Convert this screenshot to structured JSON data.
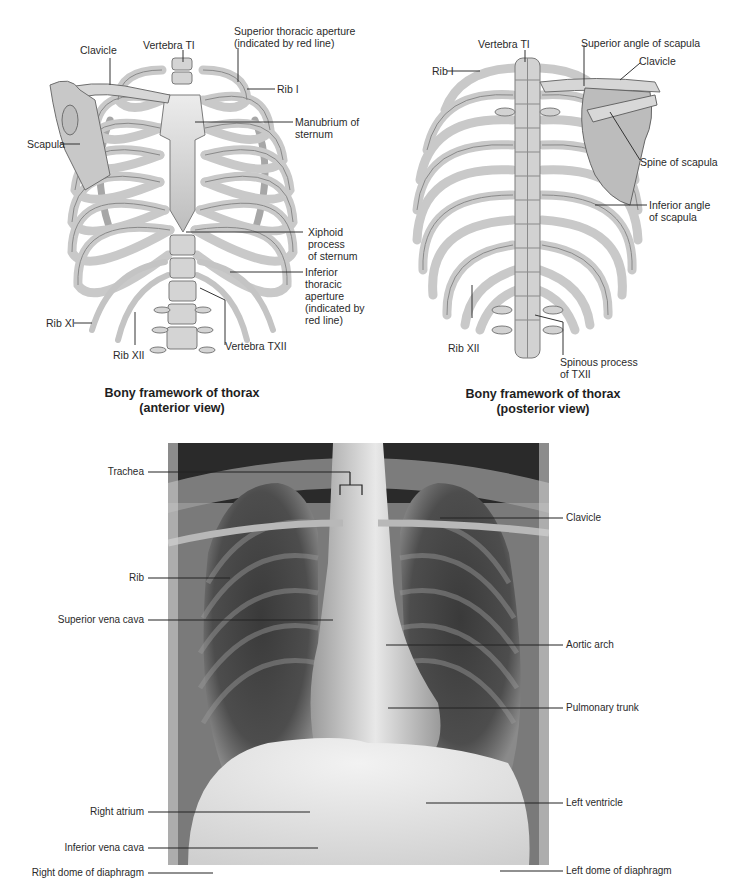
{
  "anterior": {
    "caption": "Bony framework of thorax\n(anterior view)",
    "labels": {
      "clavicle": "Clavicle",
      "vertebra_t1": "Vertebra TI",
      "superior_aperture": "Superior thoracic aperture\n(indicated by red line)",
      "rib_1": "Rib I",
      "manubrium": "Manubrium of\nsternum",
      "scapula": "Scapula",
      "xiphoid": "Xiphoid process\nof sternum",
      "inferior_aperture": "Inferior thoracic\naperture\n(indicated by red line)",
      "rib_11": "Rib XI",
      "rib_12": "Rib XII",
      "vertebra_t12": "Vertebra TXII"
    }
  },
  "posterior": {
    "caption": "Bony framework of thorax\n(posterior view)",
    "labels": {
      "vertebra_t1": "Vertebra TI",
      "superior_angle": "Superior angle of scapula",
      "clavicle": "Clavicle",
      "rib_1": "Rib I",
      "spine_scapula": "Spine of scapula",
      "inferior_angle": "Inferior angle\nof scapula",
      "rib_12": "Rib XII",
      "spinous_t12": "Spinous process\nof TXII"
    }
  },
  "xray": {
    "labels_left": {
      "trachea": "Trachea",
      "rib": "Rib",
      "svc": "Superior vena cava",
      "right_atrium": "Right atrium",
      "ivc": "Inferior vena cava",
      "right_dome": "Right dome of diaphragm"
    },
    "labels_right": {
      "clavicle": "Clavicle",
      "aortic_arch": "Aortic arch",
      "pulmonary_trunk": "Pulmonary trunk",
      "left_ventricle": "Left ventricle",
      "left_dome": "Left dome of diaphragm",
      "costodiaphragmatic": "Costodiaphragmatic recess"
    }
  },
  "colors": {
    "bone_fill": "#dcdcdc",
    "bone_stroke": "#6e6e6e",
    "leader_line": "#333333",
    "xray_dark": "#151515"
  }
}
